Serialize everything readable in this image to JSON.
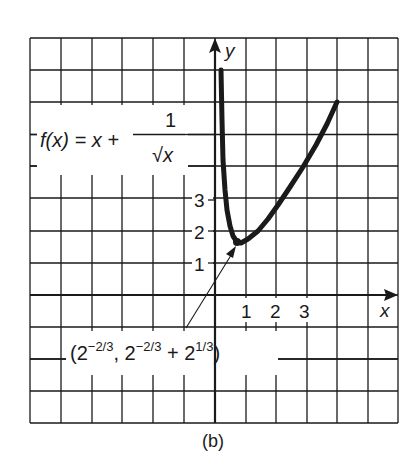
{
  "chart_data": {
    "type": "line",
    "title": "",
    "function_label": {
      "lhs": "f(x) = x +",
      "numerator": "1",
      "denominator": "√x"
    },
    "xlabel": "x",
    "ylabel": "y",
    "x_ticks": [
      "1",
      "2",
      "3"
    ],
    "y_ticks": [
      "1",
      "2",
      "3"
    ],
    "xlim": [
      -6,
      6
    ],
    "ylim": [
      -4,
      8
    ],
    "grid": true,
    "legend": null,
    "annotation": {
      "text_parts": {
        "open": "(2",
        "exp1": "−2/3",
        "comma": ", 2",
        "exp2": "−2/3",
        "plus": " + 2",
        "exp3": "1/3",
        "close": ")"
      },
      "points_to": [
        0.63,
        1.89
      ]
    },
    "series": [
      {
        "name": "f(x) = x + 1/√x",
        "x": [
          0.2,
          0.25,
          0.3,
          0.4,
          0.5,
          0.63,
          0.8,
          1.0,
          1.5,
          2.0,
          2.5,
          3.0,
          3.5,
          4.0
        ],
        "y": [
          7.2,
          5.5,
          4.0,
          2.6,
          2.1,
          1.89,
          2.1,
          2.3,
          2.9,
          3.7,
          4.4,
          5.2,
          6.1,
          6.0
        ]
      }
    ],
    "caption": "(b)"
  }
}
